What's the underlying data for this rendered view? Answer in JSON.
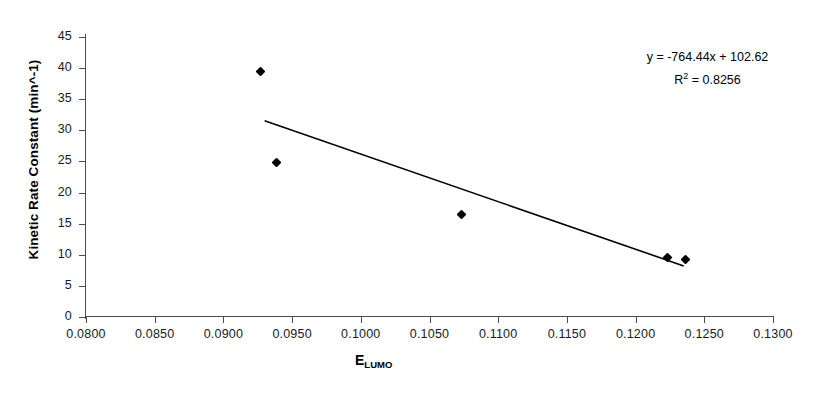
{
  "chart_data": {
    "type": "scatter",
    "title": "",
    "xlabel": "E_LUMO",
    "xlabel_base": "E",
    "xlabel_sub": "LUMO",
    "ylabel": "Kinetic Rate Constant (min^-1)",
    "xlim": [
      0.08,
      0.13
    ],
    "ylim": [
      0,
      45
    ],
    "xticks": [
      "0.0800",
      "0.0850",
      "0.0900",
      "0.0950",
      "0.1000",
      "0.1050",
      "0.1100",
      "0.1150",
      "0.1200",
      "0.1250",
      "0.1300"
    ],
    "xtick_values": [
      0.08,
      0.085,
      0.09,
      0.095,
      0.1,
      0.105,
      0.11,
      0.115,
      0.12,
      0.125,
      0.13
    ],
    "yticks": [
      "0",
      "5",
      "10",
      "15",
      "20",
      "25",
      "30",
      "35",
      "40",
      "45"
    ],
    "ytick_values": [
      0,
      5,
      10,
      15,
      20,
      25,
      30,
      35,
      40,
      45
    ],
    "grid": false,
    "legend": false,
    "marker": "diamond",
    "marker_color": "#000000",
    "points": [
      {
        "x": 0.0927,
        "y": 39.4
      },
      {
        "x": 0.0939,
        "y": 24.8
      },
      {
        "x": 0.1073,
        "y": 16.4
      },
      {
        "x": 0.1223,
        "y": 9.6
      },
      {
        "x": 0.1236,
        "y": 9.2
      }
    ],
    "trendline": {
      "type": "linear",
      "slope": -764.44,
      "intercept": 102.62,
      "r_squared": 0.8256,
      "x_start": 0.093,
      "x_end": 0.1235,
      "color": "#000000"
    },
    "annotations": {
      "equation": "y = -764.44x + 102.62",
      "r_squared_prefix": "R",
      "r_squared_exponent": "2",
      "r_squared_value": " = 0.8256"
    }
  },
  "colors": {
    "axis": "#4d4d4d",
    "text": "#1a1a1a",
    "data": "#000000",
    "background": "#ffffff"
  }
}
